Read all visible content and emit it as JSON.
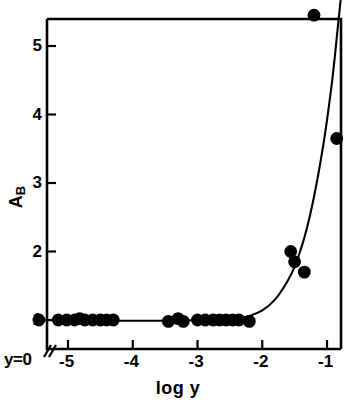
{
  "figure": {
    "background": "#ffffff",
    "ink": "#000000"
  },
  "axes": {
    "xlabel": "log y",
    "ylabel_main": "A",
    "ylabel_sub": "B",
    "origin_label": "y=0",
    "x_ticks": [
      "-5",
      "-4",
      "-3",
      "-2",
      "-1"
    ],
    "y_ticks": [
      "1",
      "2",
      "3",
      "4",
      "5"
    ]
  },
  "chart_data": {
    "type": "scatter",
    "title": "",
    "xlabel": "log y",
    "ylabel": "A/B",
    "xlim": [
      -5.45,
      -0.7
    ],
    "ylim": [
      0.62,
      5.82
    ],
    "grid": false,
    "legend": null,
    "x_tick_values": [
      -5,
      -4,
      -3,
      -2,
      -1
    ],
    "y_tick_values": [
      1,
      2,
      3,
      4,
      5
    ],
    "axis_break_at_origin": true,
    "origin_category": "y=0",
    "points": [
      {
        "x": -5.45,
        "y": 1.0,
        "note": "y=0 axis point"
      },
      {
        "x": -5.15,
        "y": 1.0
      },
      {
        "x": -5.02,
        "y": 1.0
      },
      {
        "x": -4.9,
        "y": 1.0
      },
      {
        "x": -4.82,
        "y": 1.02
      },
      {
        "x": -4.74,
        "y": 1.0
      },
      {
        "x": -4.62,
        "y": 1.0
      },
      {
        "x": -4.5,
        "y": 1.0
      },
      {
        "x": -4.4,
        "y": 1.0
      },
      {
        "x": -4.3,
        "y": 1.0
      },
      {
        "x": -3.45,
        "y": 0.98
      },
      {
        "x": -3.3,
        "y": 1.02
      },
      {
        "x": -3.22,
        "y": 0.98
      },
      {
        "x": -3.0,
        "y": 1.0
      },
      {
        "x": -2.88,
        "y": 1.0
      },
      {
        "x": -2.76,
        "y": 1.0
      },
      {
        "x": -2.66,
        "y": 1.0
      },
      {
        "x": -2.56,
        "y": 1.0
      },
      {
        "x": -2.46,
        "y": 1.0
      },
      {
        "x": -2.36,
        "y": 1.0
      },
      {
        "x": -2.2,
        "y": 0.98
      },
      {
        "x": -1.56,
        "y": 2.0
      },
      {
        "x": -1.5,
        "y": 1.85
      },
      {
        "x": -1.35,
        "y": 1.7
      },
      {
        "x": -1.2,
        "y": 5.45
      },
      {
        "x": -0.85,
        "y": 3.65
      }
    ],
    "fitted_curve": [
      {
        "x": -5.45,
        "y": 1.0
      },
      {
        "x": -4.6,
        "y": 0.99
      },
      {
        "x": -3.6,
        "y": 0.99
      },
      {
        "x": -2.8,
        "y": 1.0
      },
      {
        "x": -2.4,
        "y": 1.02
      },
      {
        "x": -2.2,
        "y": 1.06
      },
      {
        "x": -2.0,
        "y": 1.14
      },
      {
        "x": -1.8,
        "y": 1.3
      },
      {
        "x": -1.62,
        "y": 1.55
      },
      {
        "x": -1.5,
        "y": 1.78
      },
      {
        "x": -1.35,
        "y": 2.2
      },
      {
        "x": -1.2,
        "y": 2.8
      },
      {
        "x": -1.05,
        "y": 3.6
      },
      {
        "x": -0.92,
        "y": 4.5
      },
      {
        "x": -0.82,
        "y": 5.4
      },
      {
        "x": -0.78,
        "y": 5.75
      }
    ]
  }
}
